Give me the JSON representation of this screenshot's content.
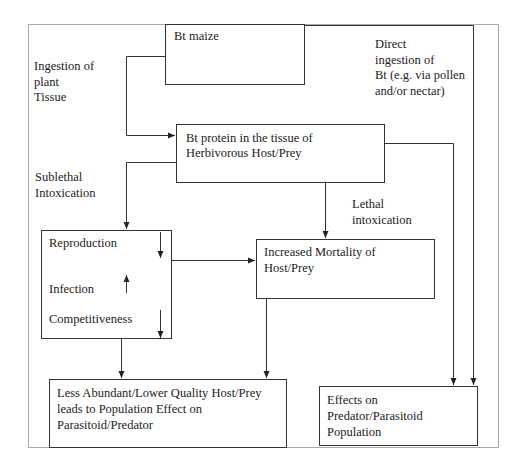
{
  "boxes": {
    "bt_maize": "Bt maize",
    "bt_protein": [
      "Bt protein in the tissue of",
      "Herbivorous Host/Prey"
    ],
    "effects_box": {
      "reproduction": "Reproduction",
      "infection": "Infection",
      "competitiveness": "Competitiveness"
    },
    "mortality": [
      "Increased Mortality of",
      "Host/Prey"
    ],
    "less_abundant": [
      "Less Abundant/Lower Quality Host/Prey",
      "leads to Population Effect on",
      "Parasitoid/Predator"
    ],
    "predator_effects": [
      "Effects on",
      "Predator/Parasitoid",
      "Population"
    ]
  },
  "labels": {
    "ingestion": [
      "Ingestion of",
      "plant",
      "Tissue"
    ],
    "direct": [
      "Direct",
      "ingestion of",
      "Bt (e.g. via pollen",
      "and/or nectar)"
    ],
    "sublethal": [
      "Sublethal",
      "Intoxication"
    ],
    "lethal": [
      "Lethal",
      "intoxication"
    ]
  }
}
